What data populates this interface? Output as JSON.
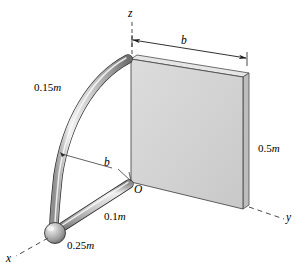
{
  "figure": {
    "background_color": "#ffffff",
    "plate_fill_color": "#d3d3d3",
    "plate_edge_color": "#c9c9c9",
    "rod_color": "#b5b5b5",
    "outline_color": "#1a1a1a"
  },
  "axes": [
    {
      "name": "z-axis",
      "label": "z",
      "style": "dashed",
      "direction": "up"
    },
    {
      "name": "y-axis",
      "label": "y",
      "style": "dashed",
      "direction": "lower-right"
    },
    {
      "name": "x-axis",
      "label": "x",
      "style": "dashed",
      "direction": "lower-left"
    }
  ],
  "origin": {
    "label": "O"
  },
  "dimensions": [
    {
      "name": "arc-length",
      "value": "0.15",
      "unit": "m"
    },
    {
      "name": "rod-length",
      "value": "0.1",
      "unit": "m"
    },
    {
      "name": "sphere-size",
      "value": "0.25",
      "unit": "m"
    },
    {
      "name": "plate-height",
      "value": "0.5",
      "unit": "m"
    }
  ],
  "symbols": [
    {
      "name": "plate-width-b",
      "label": "b"
    },
    {
      "name": "arc-radius-b",
      "label": "b"
    }
  ]
}
